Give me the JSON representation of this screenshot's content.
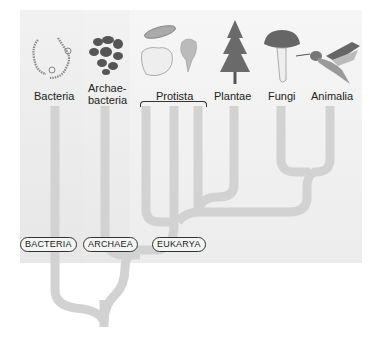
{
  "diagram": {
    "type": "phylogenetic-tree",
    "colors": {
      "branch": "#d2d2d2",
      "panel": "#f2f2f2",
      "text": "#222222"
    },
    "organisms": [
      {
        "id": "bacteria",
        "label": "Bacteria",
        "icon": "bacteria-chain-icon"
      },
      {
        "id": "archaebacteria",
        "label_line1": "Archae-",
        "label_line2": "bacteria",
        "icon": "archaebacteria-cells-icon"
      },
      {
        "id": "protista",
        "label": "Protista",
        "icon": "protists-icon"
      },
      {
        "id": "plantae",
        "label": "Plantae",
        "icon": "conifer-tree-icon"
      },
      {
        "id": "fungi",
        "label": "Fungi",
        "icon": "mushroom-icon"
      },
      {
        "id": "animalia",
        "label": "Animalia",
        "icon": "hummingbird-icon"
      }
    ],
    "domains": [
      {
        "id": "bacteria",
        "label": "BACTERIA"
      },
      {
        "id": "archaea",
        "label": "ARCHAEA"
      },
      {
        "id": "eukarya",
        "label": "EUKARYA"
      }
    ]
  }
}
